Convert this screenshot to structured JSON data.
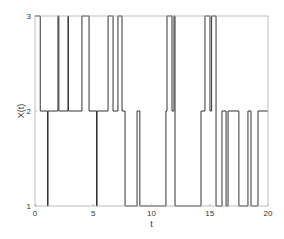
{
  "chart_data": {
    "type": "line",
    "subtype": "step",
    "title": "",
    "xlabel": "t",
    "ylabel": "X(t)",
    "xlim": [
      0,
      20
    ],
    "ylim": [
      1,
      3
    ],
    "xticks": [
      0,
      5,
      10,
      15,
      20
    ],
    "yticks": [
      1,
      2,
      3
    ],
    "grid": false,
    "legend": null,
    "line_color": "#333333",
    "series": [
      {
        "name": "X(t)",
        "points": [
          [
            0.0,
            3
          ],
          [
            0.45,
            3
          ],
          [
            0.45,
            2
          ],
          [
            1.07,
            2
          ],
          [
            1.07,
            1
          ],
          [
            1.12,
            1
          ],
          [
            1.12,
            2
          ],
          [
            1.97,
            2
          ],
          [
            1.97,
            3
          ],
          [
            2.05,
            3
          ],
          [
            2.05,
            2
          ],
          [
            2.83,
            2
          ],
          [
            2.83,
            3
          ],
          [
            2.87,
            3
          ],
          [
            2.87,
            2
          ],
          [
            4.03,
            2
          ],
          [
            4.03,
            3
          ],
          [
            4.64,
            3
          ],
          [
            4.64,
            2
          ],
          [
            5.28,
            2
          ],
          [
            5.28,
            1
          ],
          [
            5.33,
            1
          ],
          [
            5.33,
            2
          ],
          [
            6.27,
            2
          ],
          [
            6.27,
            3
          ],
          [
            6.7,
            3
          ],
          [
            6.7,
            2
          ],
          [
            7.12,
            2
          ],
          [
            7.12,
            3
          ],
          [
            7.47,
            3
          ],
          [
            7.47,
            2
          ],
          [
            7.73,
            2
          ],
          [
            7.73,
            1
          ],
          [
            8.76,
            1
          ],
          [
            8.76,
            2
          ],
          [
            9.0,
            2
          ],
          [
            9.0,
            1
          ],
          [
            11.24,
            1
          ],
          [
            11.24,
            2
          ],
          [
            11.33,
            2
          ],
          [
            11.33,
            3
          ],
          [
            11.76,
            3
          ],
          [
            11.76,
            2
          ],
          [
            11.93,
            2
          ],
          [
            11.93,
            3
          ],
          [
            12.02,
            3
          ],
          [
            12.02,
            1
          ],
          [
            14.25,
            1
          ],
          [
            14.25,
            2
          ],
          [
            14.59,
            2
          ],
          [
            14.59,
            3
          ],
          [
            15.02,
            3
          ],
          [
            15.02,
            2
          ],
          [
            15.16,
            2
          ],
          [
            15.16,
            3
          ],
          [
            15.54,
            3
          ],
          [
            15.54,
            1
          ],
          [
            16.05,
            1
          ],
          [
            16.05,
            2
          ],
          [
            16.4,
            2
          ],
          [
            16.4,
            1
          ],
          [
            16.57,
            1
          ],
          [
            16.57,
            2
          ],
          [
            17.5,
            2
          ],
          [
            17.5,
            1
          ],
          [
            18.28,
            1
          ],
          [
            18.28,
            2
          ],
          [
            18.54,
            2
          ],
          [
            18.54,
            1
          ],
          [
            19.14,
            1
          ],
          [
            19.14,
            2
          ],
          [
            20.0,
            2
          ]
        ]
      }
    ]
  },
  "axes": {
    "x_label": "t",
    "y_label": "X(t)",
    "x_tick_labels": [
      "0",
      "5",
      "10",
      "15",
      "20"
    ],
    "y_tick_labels": [
      "1",
      "2",
      "3"
    ]
  }
}
